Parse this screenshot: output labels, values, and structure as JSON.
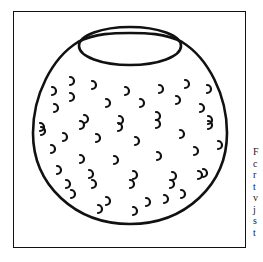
{
  "figure": {
    "stroke_color": "#111111",
    "background": "#ffffff"
  },
  "side_text": {
    "lines": [
      "F",
      "c",
      "r",
      "t",
      "v",
      "j",
      "s",
      "t"
    ]
  }
}
